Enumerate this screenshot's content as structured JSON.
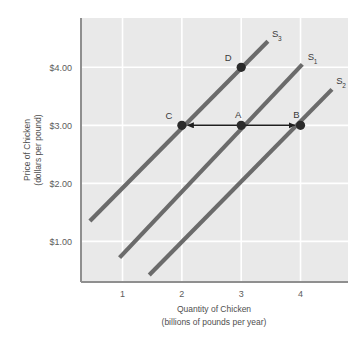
{
  "chart_data": {
    "type": "line",
    "title": "",
    "xlabel": "Quantity of Chicken",
    "xlabel_sub": "(billions of pounds per year)",
    "ylabel": "Price of Chicken",
    "ylabel_sub": "(dollars per pound)",
    "xlim": [
      0.3,
      4.8
    ],
    "ylim": [
      0.3,
      4.85
    ],
    "grid": true,
    "legend_position": "inline-curve-end",
    "x_ticks": [
      {
        "value": 1,
        "label": "1"
      },
      {
        "value": 2,
        "label": "2"
      },
      {
        "value": 3,
        "label": "3"
      },
      {
        "value": 4,
        "label": "4"
      }
    ],
    "y_ticks": [
      {
        "value": 1,
        "label": "$1.00"
      },
      {
        "value": 2,
        "label": "$2.00"
      },
      {
        "value": 3,
        "label": "$3.00"
      },
      {
        "value": 4,
        "label": "$4.00"
      }
    ],
    "series": [
      {
        "name": "S3",
        "label": "S",
        "subscript": "3",
        "x": [
          0.45,
          3.45
        ],
        "y": [
          1.35,
          4.45
        ],
        "label_x": 3.52,
        "label_y": 4.52
      },
      {
        "name": "S1",
        "label": "S",
        "subscript": "1",
        "x": [
          0.95,
          4.03
        ],
        "y": [
          0.72,
          4.05
        ],
        "label_x": 4.12,
        "label_y": 4.12
      },
      {
        "name": "S2",
        "label": "S",
        "subscript": "2",
        "x": [
          1.45,
          4.53
        ],
        "y": [
          0.42,
          3.62
        ],
        "label_x": 4.6,
        "label_y": 3.72
      }
    ],
    "points": [
      {
        "label": "D",
        "x": 3,
        "y": 4,
        "series": "S3",
        "label_dx": -13,
        "label_dy": -6
      },
      {
        "label": "C",
        "x": 2,
        "y": 3,
        "series": "S3",
        "label_dx": -13,
        "label_dy": -6
      },
      {
        "label": "A",
        "x": 3,
        "y": 3,
        "series": "S1",
        "label_dx": -3,
        "label_dy": -7
      },
      {
        "label": "B",
        "x": 4,
        "y": 3,
        "series": "S2",
        "label_dx": -4,
        "label_dy": -7
      }
    ],
    "annotations": [
      {
        "name": "shift-left-arrow",
        "from_point": "A",
        "to_point": "C",
        "direction": "left",
        "price": 3
      },
      {
        "name": "shift-right-arrow",
        "from_point": "A",
        "to_point": "B",
        "direction": "right",
        "price": 3
      }
    ]
  },
  "style": {
    "plot_background": "#e9e9e9",
    "grid_color": "#ffffff",
    "axis_color": "#8f8f8f",
    "curve_color": "#6b6b6b",
    "point_color": "#2b2b2b",
    "arrow_color": "#1f1f1f",
    "text_color": "#5a5a5a"
  }
}
